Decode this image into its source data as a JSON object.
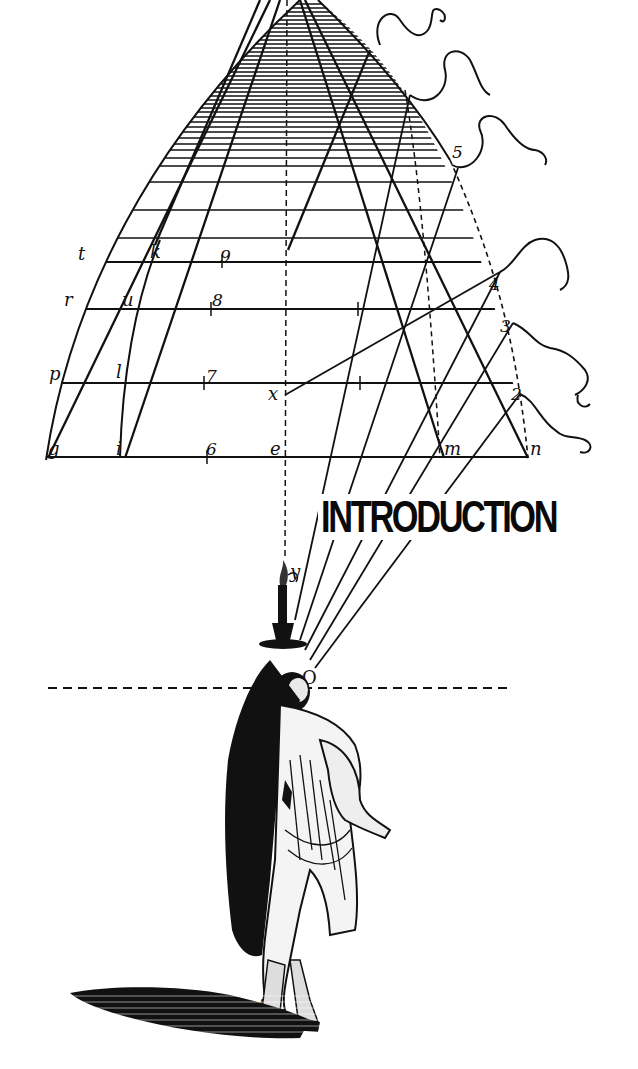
{
  "title": "INTRODUCTION",
  "labels": {
    "t": "t",
    "k": "k",
    "nine": "9",
    "r": "r",
    "u": "u",
    "eight": "8",
    "p": "p",
    "l": "l",
    "seven": "7",
    "x": "x",
    "g": "g",
    "i": "i",
    "six": "6",
    "e": "e",
    "m": "m",
    "n": "n",
    "two": "2",
    "three": "3",
    "four": "4",
    "five": "5",
    "y": "y",
    "O": "O",
    "A": "A"
  },
  "colors": {
    "ink": "#111111",
    "paper": "#ffffff"
  }
}
